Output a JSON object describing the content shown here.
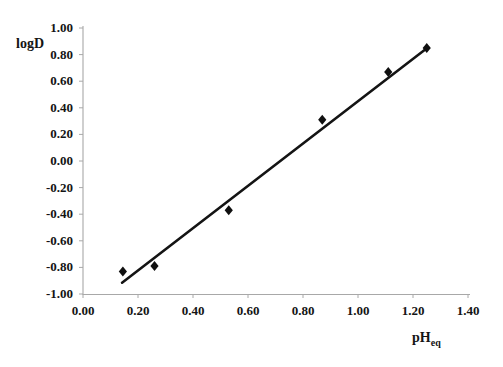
{
  "chart_data": {
    "type": "scatter",
    "title": "",
    "xlabel": "pHeq",
    "xlabel_base": "pH",
    "xlabel_sub": "eq",
    "ylabel": "logD",
    "xlim": [
      0.0,
      1.4
    ],
    "ylim": [
      -1.0,
      1.0
    ],
    "xticks": [
      "0.00",
      "0.20",
      "0.40",
      "0.60",
      "0.80",
      "1.00",
      "1.20",
      "1.40"
    ],
    "xtick_values": [
      0.0,
      0.2,
      0.4,
      0.6,
      0.8,
      1.0,
      1.2,
      1.4
    ],
    "yticks": [
      "1.00",
      "0.80",
      "0.60",
      "0.40",
      "0.20",
      "0.00",
      "-0.20",
      "-0.40",
      "-0.60",
      "-0.80",
      "-1.00"
    ],
    "ytick_values": [
      1.0,
      0.8,
      0.6,
      0.4,
      0.2,
      0.0,
      -0.2,
      -0.4,
      -0.6,
      -0.8,
      -1.0
    ],
    "grid": false,
    "legend": "none",
    "series": [
      {
        "name": "logD vs pHeq",
        "marker": "diamond",
        "marker_color": "#101010",
        "points": [
          {
            "x": 0.145,
            "y": -0.83
          },
          {
            "x": 0.26,
            "y": -0.79
          },
          {
            "x": 0.53,
            "y": -0.37
          },
          {
            "x": 0.87,
            "y": 0.31
          },
          {
            "x": 1.11,
            "y": 0.67
          },
          {
            "x": 1.25,
            "y": 0.85
          }
        ]
      }
    ],
    "trendline": {
      "name": "linear fit",
      "color": "#141414",
      "x_start": 0.142,
      "y_start": -0.915,
      "x_end": 1.255,
      "y_end": 0.855
    },
    "axis_color": "#9a9a9a",
    "spine_color": "#b0b0b0"
  }
}
